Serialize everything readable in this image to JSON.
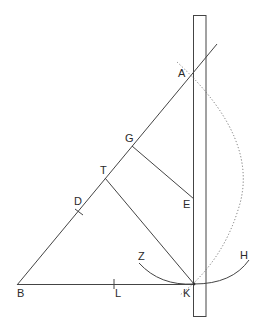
{
  "diagram": {
    "type": "geometric-construction",
    "colors": {
      "line": "#444444",
      "dotted": "#777777",
      "background": "#ffffff"
    },
    "labels": {
      "A": "A",
      "G": "G",
      "T": "T",
      "D": "D",
      "E": "E",
      "Z": "Z",
      "H": "H",
      "B": "B",
      "L": "L",
      "K": "K"
    },
    "elements": {
      "ruler": "vertical ruler (rectangle)",
      "line_BA": "line from B through A",
      "line_BK": "baseline from B to K",
      "line_GE": "segment G to E",
      "line_TK": "segment T to K",
      "arc_ZH": "arc Z through K to H",
      "dotted_arc": "dotted arc through A to K"
    }
  }
}
